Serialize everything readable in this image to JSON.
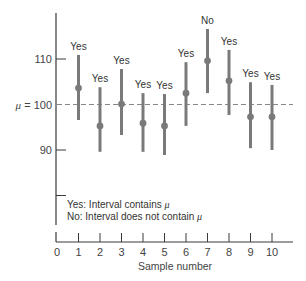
{
  "chart_data": {
    "type": "scatter",
    "subtype": "confidence-intervals",
    "title": "",
    "xlabel": "Sample number",
    "ylabel": "",
    "xlim": [
      0,
      10
    ],
    "ylim": [
      80,
      120
    ],
    "x_ticks": [
      0,
      1,
      2,
      3,
      4,
      5,
      6,
      7,
      8,
      9,
      10
    ],
    "x_tick_labels": [
      "0",
      "1",
      "2",
      "3",
      "4",
      "5",
      "6",
      "7",
      "8",
      "9",
      "10"
    ],
    "y_ticks": [
      110,
      90,
      80
    ],
    "y_tick_labels": [
      "110",
      "90",
      ""
    ],
    "y_axis_break": true,
    "grid": false,
    "reference_line": {
      "value": 100,
      "label_symbol": "μ",
      "label_text": " = 100",
      "style": "dashed"
    },
    "series": [
      {
        "name": "intervals",
        "x": [
          1,
          2,
          3,
          4,
          5,
          6,
          7,
          8,
          9,
          10
        ],
        "mean": [
          103.6,
          95.3,
          100.1,
          95.9,
          95.3,
          102.5,
          109.6,
          105.2,
          97.3,
          97.3
        ],
        "lower": [
          96.6,
          89.6,
          93.3,
          89.6,
          88.9,
          95.3,
          102.5,
          97.7,
          90.4,
          90.0
        ],
        "upper": [
          110.9,
          103.8,
          107.8,
          102.5,
          102.3,
          109.3,
          116.6,
          112.0,
          104.9,
          104.3
        ],
        "annotations": [
          "Yes",
          "Yes",
          "Yes",
          "Yes",
          "Yes",
          "Yes",
          "No",
          "Yes",
          "Yes",
          "Yes"
        ]
      }
    ],
    "legend": {
      "placement": "bottom-left",
      "lines": [
        {
          "prefix": "Yes: Interval contains ",
          "symbol": "μ"
        },
        {
          "prefix": "No: Interval does not contain ",
          "symbol": "μ"
        }
      ]
    },
    "colors": {
      "interval": "#7a7a7a",
      "axis": "#3a3a3a",
      "reference": "#888888"
    }
  }
}
